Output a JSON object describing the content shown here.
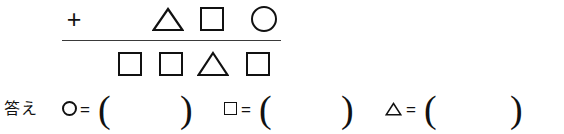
{
  "worksheet": {
    "type": "shape-arithmetic-puzzle",
    "language": "ja",
    "background_color": "#ffffff",
    "ink_color": "#111111",
    "rule_color": "#3a3a3a"
  },
  "arithmetic": {
    "operator": "+",
    "operator_name": "plus-sign",
    "addend_row": {
      "name": "addend-row",
      "shapes": [
        "triangle",
        "square",
        "circle"
      ]
    },
    "sum_row": {
      "name": "sum-row",
      "shapes": [
        "square",
        "square",
        "triangle",
        "square"
      ]
    },
    "rule": {
      "name": "fraction-rule",
      "visible": true
    }
  },
  "answer": {
    "label": "答え",
    "equals_sign": "=",
    "open_paren": "(",
    "close_paren": ")",
    "entries": [
      {
        "shape": "circle",
        "shape_label": "○",
        "value": "",
        "placeholder": ""
      },
      {
        "shape": "square",
        "shape_label": "□",
        "value": "",
        "placeholder": ""
      },
      {
        "shape": "triangle",
        "shape_label": "△",
        "value": "",
        "placeholder": ""
      }
    ]
  }
}
